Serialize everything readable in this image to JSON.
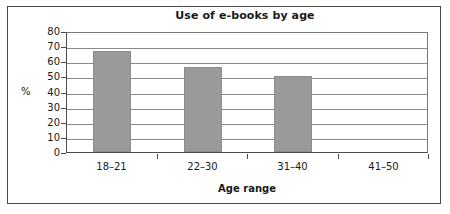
{
  "chart_data": {
    "type": "bar",
    "title": "Use of e-books by age",
    "xlabel": "Age range",
    "ylabel": "%",
    "categories": [
      "18–21",
      "22–30",
      "31–40",
      "41–50"
    ],
    "values": [
      67,
      56,
      50,
      0
    ],
    "ylim": [
      0,
      80
    ],
    "ytick_step": 10,
    "yticks": [
      "80",
      "70",
      "60",
      "50",
      "40",
      "30",
      "20",
      "10",
      "0"
    ],
    "grid": true,
    "legend": false,
    "bar_color": "#9a9a9a",
    "axis_color": "#4a4a4a",
    "grid_color": "#8a8a8a",
    "background": "#ffffff"
  }
}
